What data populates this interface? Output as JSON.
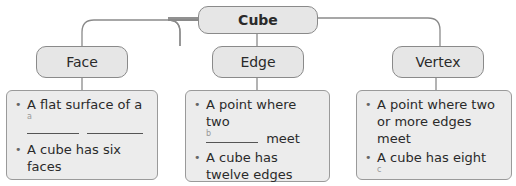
{
  "root": {
    "label": "Cube"
  },
  "branches": [
    {
      "label": "Face",
      "items": [
        {
          "text": "A flat surface of a",
          "blank_label": "a"
        },
        {
          "text": "A cube has six faces"
        }
      ]
    },
    {
      "label": "Edge",
      "items": [
        {
          "text": "A point where two",
          "blank_label": "b",
          "after_blank": "meet"
        },
        {
          "text": "A cube has twelve edges"
        }
      ]
    },
    {
      "label": "Vertex",
      "items": [
        {
          "text": "A point where two or more edges meet"
        },
        {
          "text": "A cube has eight",
          "blank_label": "c"
        }
      ]
    }
  ]
}
